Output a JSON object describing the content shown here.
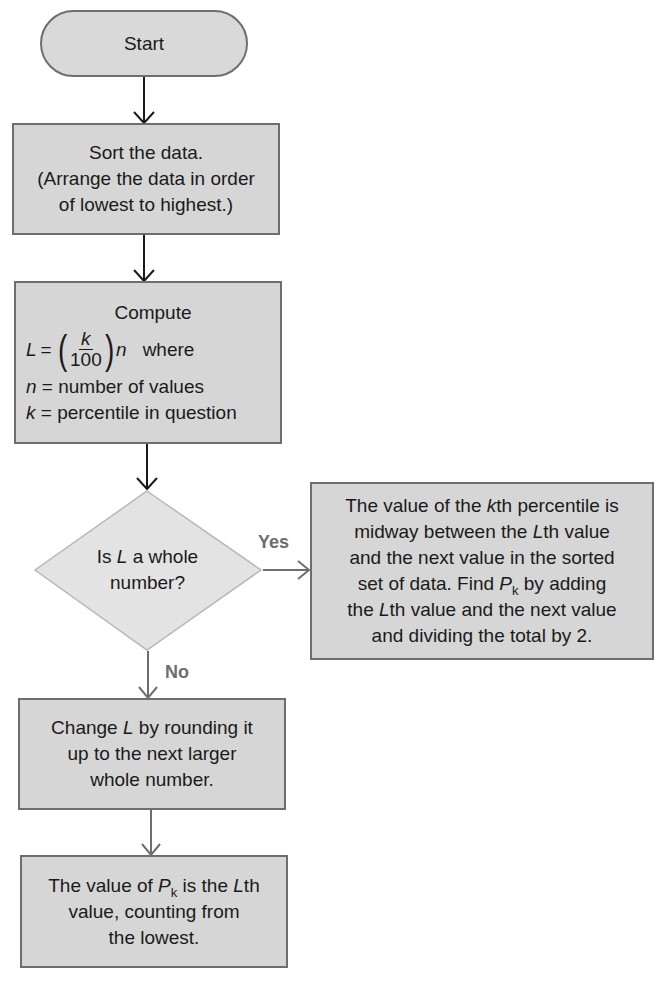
{
  "flowchart": {
    "title": "Finding the kth percentile",
    "start": {
      "label": "Start"
    },
    "sort": {
      "lines": [
        "Sort the data.",
        "(Arrange the data in order",
        "of lowest to highest.)"
      ]
    },
    "compute": {
      "heading": "Compute",
      "formula_lhs": "L",
      "formula_eq": "=",
      "formula_num": "k",
      "formula_den": "100",
      "formula_var": "n",
      "formula_where": "where",
      "def_n_var": "n",
      "def_n_text": "= number of values",
      "def_k_var": "k",
      "def_k_text": "= percentile in question"
    },
    "decision": {
      "line1_pre": "Is ",
      "line1_var": "L",
      "line1_post": " a whole",
      "line2": "number?"
    },
    "yes_label": "Yes",
    "no_label": "No",
    "yes_box": {
      "l1_pre": "The value of the ",
      "l1_var": "k",
      "l1_post": "th percentile is",
      "l2_pre": "midway between the ",
      "l2_var": "L",
      "l2_post": "th value",
      "l3": "and the next value in the sorted",
      "l4_pre": "set of data. Find ",
      "l4_var": "P",
      "l4_sub": "k",
      "l4_post": " by adding",
      "l5_pre": "the ",
      "l5_var": "L",
      "l5_post": "th value and the next value",
      "l6": "and dividing the total by 2."
    },
    "round_box": {
      "l1_pre": "Change ",
      "l1_var": "L",
      "l1_post": " by rounding it",
      "l2": "up to the next larger",
      "l3": "whole number."
    },
    "result_box": {
      "l1_pre": "The value of ",
      "l1_var": "P",
      "l1_sub": "k",
      "l1_mid": " is the ",
      "l1_var2": "L",
      "l1_post": "th",
      "l2": "value, counting from",
      "l3": "the lowest."
    },
    "colors": {
      "box_fill": "#d6d6d6",
      "box_border": "#6e6e6e",
      "diamond_fill": "#e3e3e3",
      "label_gray": "#6e6e6e",
      "background": "#ffffff"
    }
  }
}
